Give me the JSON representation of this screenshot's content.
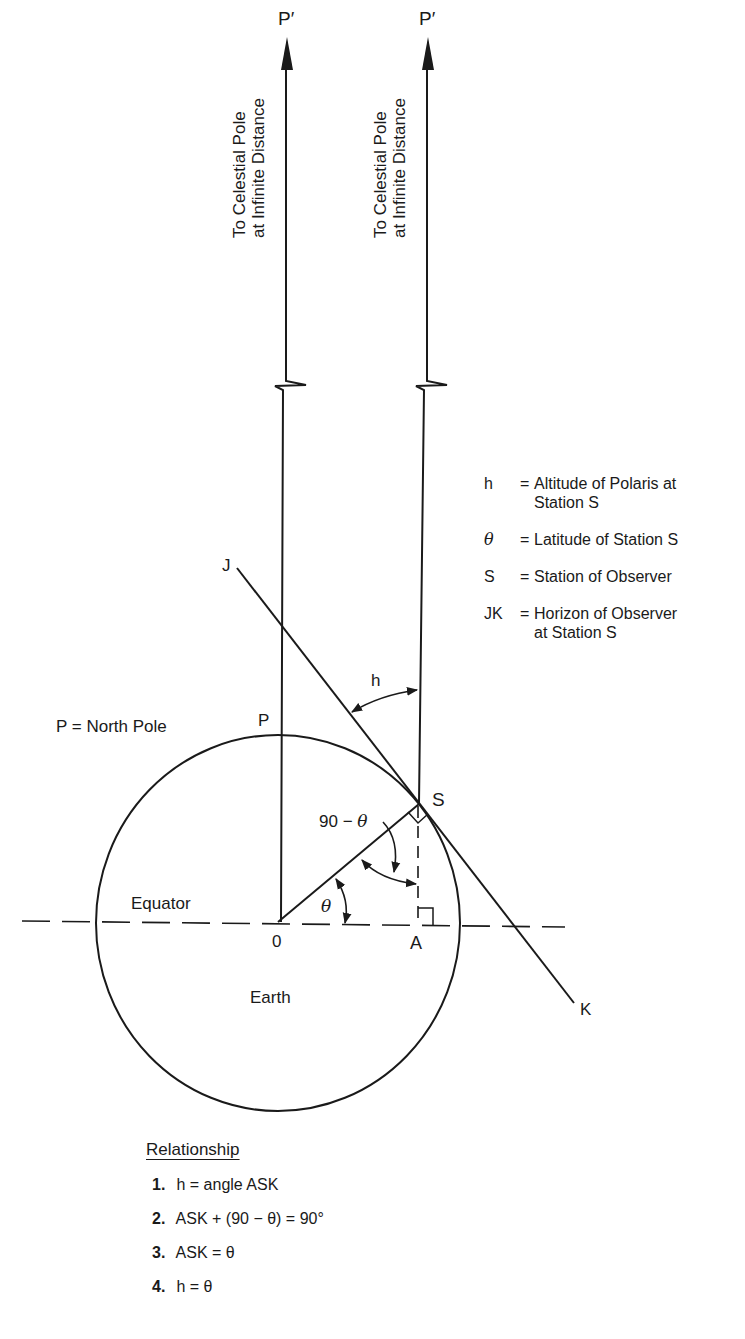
{
  "diagram": {
    "title_arrows": [
      {
        "label": "P′",
        "side_text_line1": "To Celestial Pole",
        "side_text_line2": "at Infinite Distance"
      },
      {
        "label": "P′",
        "side_text_line1": "To Celestial Pole",
        "side_text_line2": "at Infinite Distance"
      }
    ],
    "points": {
      "P": "P",
      "S": "S",
      "J": "J",
      "K": "K",
      "O": "0",
      "A": "A"
    },
    "angles": {
      "h": "h",
      "theta": "θ",
      "ninety_minus_theta_prefix": "90 − ",
      "ninety_minus_theta_symbol": "θ"
    },
    "region_labels": {
      "north_pole": "P = North Pole",
      "equator": "Equator",
      "earth": "Earth"
    },
    "legend": [
      {
        "symbol": "h",
        "eq": "=",
        "text": "Altitude of Polaris at Station S"
      },
      {
        "symbol": "θ",
        "eq": "=",
        "text": "Latitude of Station S"
      },
      {
        "symbol": "S",
        "eq": "=",
        "text": "Station of Observer"
      },
      {
        "symbol": "JK",
        "eq": "=",
        "text": "Horizon of Observer at Station S"
      }
    ],
    "relationship": {
      "heading": "Relationship",
      "items": [
        {
          "num": "1.",
          "text": "h = angle ASK"
        },
        {
          "num": "2.",
          "text": "ASK + (90 − θ) = 90°"
        },
        {
          "num": "3.",
          "text": "ASK = θ"
        },
        {
          "num": "4.",
          "text": "h = θ"
        }
      ]
    },
    "colors": {
      "ink": "#1a1a1a",
      "background": "#ffffff"
    }
  }
}
